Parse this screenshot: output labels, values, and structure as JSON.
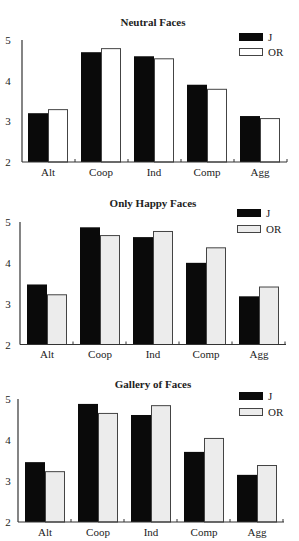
{
  "colors": {
    "J": "#0a0a0a",
    "OR_neutral": "#ffffff",
    "OR_other": "#ececec",
    "axis": "#333333",
    "bar_border": "#444444"
  },
  "chart_data": [
    {
      "type": "bar",
      "title": "Neutral Faces",
      "xlabel": "",
      "ylabel": "",
      "categories": [
        "Alt",
        "Coop",
        "Ind",
        "Comp",
        "Agg"
      ],
      "yticks": [
        2,
        3,
        4,
        5
      ],
      "ylim": [
        2,
        5
      ],
      "grid": false,
      "legend_position": "top-right",
      "series": [
        {
          "name": "J",
          "values": [
            3.2,
            4.7,
            4.6,
            3.9,
            3.13
          ]
        },
        {
          "name": "OR",
          "values": [
            3.3,
            4.8,
            4.55,
            3.8,
            3.08
          ]
        }
      ]
    },
    {
      "type": "bar",
      "title": "Only Happy Faces",
      "xlabel": "",
      "ylabel": "",
      "categories": [
        "Alt",
        "Coop",
        "Ind",
        "Comp",
        "Agg"
      ],
      "yticks": [
        2,
        3,
        4,
        5
      ],
      "ylim": [
        2,
        5
      ],
      "grid": false,
      "legend_position": "top-right",
      "series": [
        {
          "name": "J",
          "values": [
            3.47,
            4.87,
            4.63,
            4.0,
            3.18
          ]
        },
        {
          "name": "OR",
          "values": [
            3.23,
            4.68,
            4.78,
            4.38,
            3.42
          ]
        }
      ]
    },
    {
      "type": "bar",
      "title": "Gallery of Faces",
      "xlabel": "",
      "ylabel": "",
      "categories": [
        "Alt",
        "Coop",
        "Ind",
        "Comp",
        "Agg"
      ],
      "yticks": [
        2,
        3,
        4,
        5
      ],
      "ylim": [
        2,
        5
      ],
      "grid": false,
      "legend_position": "top-right",
      "series": [
        {
          "name": "J",
          "values": [
            3.46,
            4.88,
            4.61,
            3.71,
            3.15
          ]
        },
        {
          "name": "OR",
          "values": [
            3.24,
            4.66,
            4.85,
            4.05,
            3.39
          ]
        }
      ]
    }
  ],
  "charts": [
    {
      "title": "Neutral Faces",
      "legend": [
        "J",
        "OR"
      ]
    },
    {
      "title": "Only Happy Faces",
      "legend": [
        "J",
        "OR"
      ]
    },
    {
      "title": "Gallery of Faces",
      "legend": [
        "J",
        "OR"
      ]
    }
  ]
}
